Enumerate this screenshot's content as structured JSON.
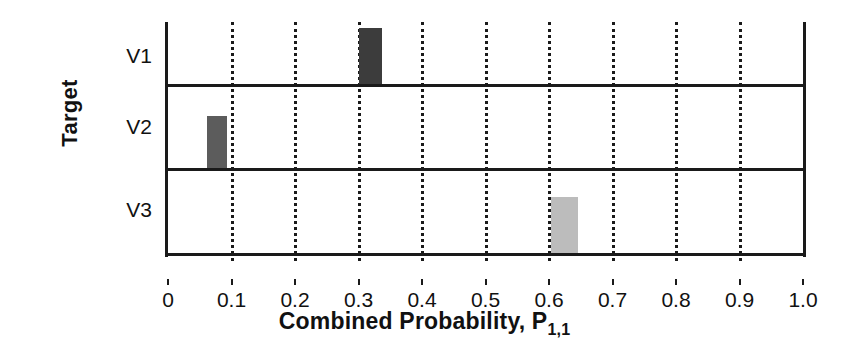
{
  "chart_data": {
    "type": "bar",
    "title": "",
    "orientation": "vertical-bars-in-horizontal-panels",
    "xlabel": "Combined Probability, P",
    "xlabel_subscript": "1,1",
    "ylabel": "Target",
    "xlim": [
      0,
      1.0
    ],
    "grid": true,
    "grid_style": "dotted-vertical",
    "legend": "none",
    "xticks": [
      "0",
      "0.1",
      "0.2",
      "0.3",
      "0.4",
      "0.5",
      "0.6",
      "0.7",
      "0.8",
      "0.9",
      "1.0"
    ],
    "xtick_values": [
      0,
      0.1,
      0.2,
      0.3,
      0.4,
      0.5,
      0.6,
      0.7,
      0.8,
      0.9,
      1.0
    ],
    "categories": [
      "V1",
      "V2",
      "V3"
    ],
    "values": [
      0.32,
      0.075,
      0.63
    ],
    "bar_widths": [
      0.037,
      0.032,
      0.043
    ],
    "bar_heights_fraction": [
      0.97,
      0.62,
      0.66
    ],
    "colors": [
      "#3c3c3c",
      "#5c5c5c",
      "#bcbcbc"
    ],
    "series": [
      {
        "name": "V1",
        "bar_start": 0.3,
        "bar_end": 0.337,
        "center": 0.318,
        "height_fraction": 0.97,
        "color": "#3c3c3c"
      },
      {
        "name": "V2",
        "bar_start": 0.0615,
        "bar_end": 0.0935,
        "center": 0.0775,
        "height_fraction": 0.62,
        "color": "#5c5c5c"
      },
      {
        "name": "V3",
        "bar_start": 0.603,
        "bar_end": 0.646,
        "center": 0.625,
        "height_fraction": 0.66,
        "color": "#bcbcbc"
      }
    ]
  },
  "axes": {
    "y_title": "Target",
    "x_title_main": "Combined Probability, P",
    "x_title_sub": "1,1",
    "tick_labels": [
      "0",
      "0.1",
      "0.2",
      "0.3",
      "0.4",
      "0.5",
      "0.6",
      "0.7",
      "0.8",
      "0.9",
      "1.0"
    ],
    "panel_labels": [
      "V1",
      "V2",
      "V3"
    ]
  },
  "colors": {
    "axis": "#1a1a1a",
    "background": "#ffffff",
    "text": "#111111",
    "bar_v1": "#3c3c3c",
    "bar_v2": "#5c5c5c",
    "bar_v3": "#bcbcbc"
  }
}
